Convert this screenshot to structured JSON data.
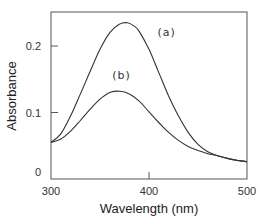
{
  "chart_data": {
    "type": "line",
    "title": "",
    "xlabel": "Wavelength (nm)",
    "ylabel": "Absorbance",
    "xlim": [
      300,
      500
    ],
    "ylim": [
      0,
      0.25
    ],
    "xticks": [
      300,
      400,
      500
    ],
    "xtick_labels": [
      "300",
      "400",
      "500"
    ],
    "yticks": [
      0,
      0.1,
      0.2
    ],
    "ytick_labels": [
      "0",
      "0.1",
      "0.2"
    ],
    "grid": false,
    "legend": "none; curves labeled inline",
    "series": [
      {
        "name": "(a)",
        "label_position": {
          "x": 418,
          "y": 0.215
        },
        "x": [
          300,
          310,
          320,
          330,
          340,
          350,
          360,
          370,
          378,
          385,
          390,
          400,
          410,
          420,
          430,
          440,
          450,
          460,
          470,
          480,
          490,
          500
        ],
        "values": [
          0.055,
          0.068,
          0.095,
          0.128,
          0.162,
          0.195,
          0.22,
          0.233,
          0.235,
          0.23,
          0.222,
          0.195,
          0.16,
          0.125,
          0.095,
          0.07,
          0.052,
          0.041,
          0.035,
          0.031,
          0.028,
          0.026
        ]
      },
      {
        "name": "(b)",
        "label_position": {
          "x": 372,
          "y": 0.151
        },
        "x": [
          300,
          310,
          320,
          330,
          340,
          350,
          360,
          370,
          380,
          390,
          400,
          410,
          420,
          430,
          440,
          450,
          460,
          470,
          480,
          490,
          500
        ],
        "values": [
          0.055,
          0.06,
          0.072,
          0.088,
          0.105,
          0.12,
          0.13,
          0.132,
          0.128,
          0.117,
          0.101,
          0.085,
          0.07,
          0.058,
          0.049,
          0.043,
          0.038,
          0.035,
          0.031,
          0.028,
          0.026
        ]
      }
    ]
  },
  "plot": {
    "x_axis_label": "Wavelength (nm)",
    "y_axis_label": "Absorbance",
    "x_ticks": [
      "300",
      "400",
      "500"
    ],
    "y_ticks": [
      "0",
      "0.1",
      "0.2"
    ],
    "curve_labels": [
      "(a)",
      "(b)"
    ],
    "line_color": "#333333",
    "frame_color": "#555555"
  }
}
